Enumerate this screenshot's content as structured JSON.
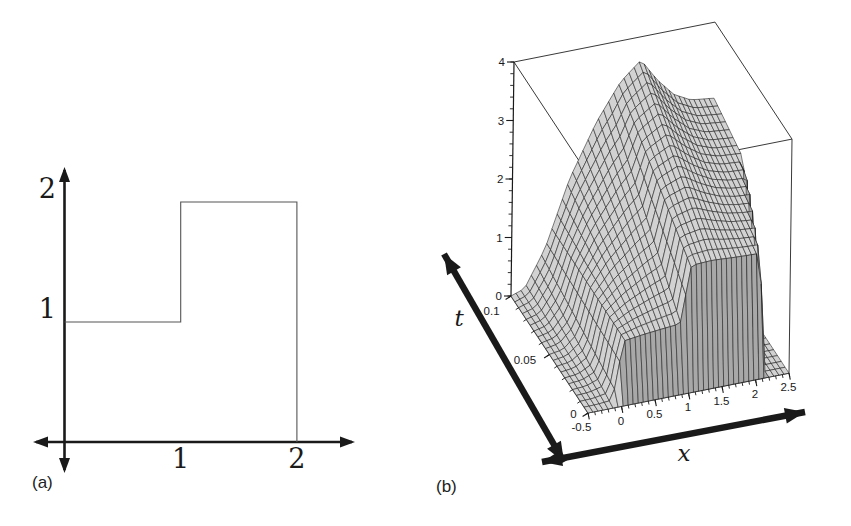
{
  "figure": {
    "caption_a": "(a)",
    "caption_b": "(b)",
    "colors": {
      "ink": "#1a1a1a",
      "curve": "#555555",
      "box_line": "#3a3a3a",
      "surface_light": "#d2d2d2",
      "surface_dark": "#a8a8a8",
      "background": "#ffffff"
    }
  },
  "chart_data": [
    {
      "type": "line",
      "panel": "a",
      "title": "step initial profile",
      "xlabel": "",
      "ylabel": "",
      "points": [
        [
          0,
          1
        ],
        [
          1,
          1
        ],
        [
          1,
          2
        ],
        [
          2,
          2
        ],
        [
          2,
          0
        ]
      ],
      "x_ticks": [
        1,
        2
      ],
      "x_tick_labels": [
        "1",
        "2"
      ],
      "y_ticks": [
        1,
        2
      ],
      "y_tick_labels": [
        "1",
        "2"
      ],
      "xlim": [
        -0.3,
        2.6
      ],
      "ylim": [
        -0.3,
        2.4
      ],
      "grid": false
    },
    {
      "type": "surface",
      "panel": "b",
      "xlabel": "x",
      "ylabel": "t",
      "zlabel": "",
      "xlim": [
        -0.5,
        2.5
      ],
      "tlim": [
        0,
        0.1
      ],
      "zlim": [
        0,
        4
      ],
      "x_ticks": [
        -0.5,
        0,
        0.5,
        1,
        1.5,
        2,
        2.5
      ],
      "x_tick_labels": [
        "-0.5",
        "0",
        "0.5",
        "1",
        "1.5",
        "2",
        "2.5"
      ],
      "t_ticks": [
        0,
        0.05,
        0.1
      ],
      "t_tick_labels": [
        "0",
        "0.05",
        "0.1"
      ],
      "z_ticks": [
        0,
        1,
        2,
        3,
        4
      ],
      "z_tick_labels": [
        "0",
        "1",
        "2",
        "3",
        "4"
      ],
      "x_minor_step": 0.1,
      "t_minor_step": 0.01,
      "z_minor_step": 0.2,
      "grid_nx": 40,
      "grid_nt": 20,
      "model": {
        "ramp_t": 0.005,
        "front_profile": [
          [
            -0.5,
            0
          ],
          [
            -0.08,
            0
          ],
          [
            0.08,
            1
          ],
          [
            0.92,
            1
          ],
          [
            1.08,
            2
          ],
          [
            2.5,
            2
          ]
        ],
        "back_profile": [
          [
            -0.5,
            0
          ],
          [
            -0.3,
            0.08
          ],
          [
            0,
            0.7
          ],
          [
            0.35,
            1.8
          ],
          [
            0.75,
            2.7
          ],
          [
            1.1,
            3.3
          ],
          [
            1.4,
            3.6
          ],
          [
            1.65,
            3.2
          ],
          [
            1.9,
            2.9
          ],
          [
            2.15,
            2.75
          ],
          [
            2.5,
            2.7
          ]
        ],
        "shock_start": 2.1,
        "shock_speed": 7,
        "shock_width": 0.06
      }
    }
  ]
}
